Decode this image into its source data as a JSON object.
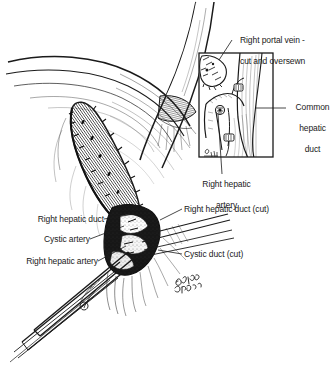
{
  "figure": {
    "kind": "medical-line-illustration",
    "technique": "pen-and-ink stipple and hatch",
    "background_color": "#ffffff",
    "ink_color": "#1a1a1a"
  },
  "labels": {
    "inset_title_line1": "Right portal vein -",
    "inset_title_line2": "cut and oversewn",
    "common_hepatic_duct_line1": "Common",
    "common_hepatic_duct_line2": "hepatic",
    "common_hepatic_duct_line3": "duct",
    "inset_bottom_line1": "Right hepatic",
    "inset_bottom_line2": "artery",
    "right_hepatic_duct": "Right hepatic duct",
    "cystic_artery": "Cystic artery",
    "right_hepatic_artery": "Right hepatic artery",
    "right_hepatic_duct_cut": "Right hepatic duct (cut)",
    "cystic_duct_cut": "Cystic duct (cut)"
  },
  "inset": {
    "border_color": "#1a1a1a",
    "x": 198,
    "y": 52,
    "width": 76,
    "height": 106
  }
}
